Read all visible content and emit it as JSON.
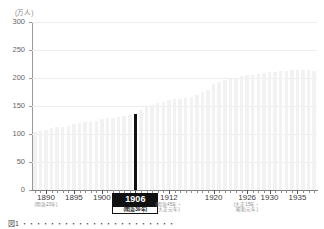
{
  "chart_data": {
    "type": "bar",
    "title": "",
    "unit_label": "(万人)",
    "xlabel": "",
    "ylabel": "",
    "ylim": [
      0,
      300
    ],
    "ytick_labels": [
      "300",
      "250",
      "200",
      "150",
      "100",
      "50",
      "0"
    ],
    "ytick_values": [
      300,
      250,
      200,
      150,
      100,
      50,
      0
    ],
    "grid": true,
    "legend": "none",
    "highlight_year": 1906,
    "highlight_value": 135,
    "x": [
      1888,
      1889,
      1890,
      1891,
      1892,
      1893,
      1894,
      1895,
      1896,
      1897,
      1898,
      1899,
      1900,
      1901,
      1902,
      1903,
      1904,
      1905,
      1906,
      1907,
      1908,
      1909,
      1910,
      1911,
      1912,
      1913,
      1914,
      1915,
      1916,
      1917,
      1918,
      1919,
      1920,
      1921,
      1922,
      1923,
      1924,
      1925,
      1926,
      1927,
      1928,
      1929,
      1930,
      1931,
      1932,
      1933,
      1934,
      1935,
      1936,
      1937,
      1938
    ],
    "values": [
      104,
      106,
      108,
      110,
      112,
      113,
      115,
      117,
      119,
      121,
      122,
      124,
      126,
      128,
      129,
      131,
      132,
      134,
      135,
      142,
      148,
      152,
      155,
      158,
      160,
      162,
      163,
      164,
      166,
      170,
      175,
      178,
      190,
      193,
      196,
      198,
      200,
      203,
      205,
      206,
      208,
      209,
      210,
      211,
      212,
      213,
      214,
      215,
      214,
      214,
      213
    ],
    "x_major_ticks": [
      {
        "year": 1890,
        "label": "1890",
        "era": [
          "(明治23年)"
        ]
      },
      {
        "year": 1895,
        "label": "1895",
        "era": []
      },
      {
        "year": 1900,
        "label": "1900",
        "era": []
      },
      {
        "year": 1906,
        "label": "1906",
        "era": [
          "(明治39年)"
        ],
        "highlight": true
      },
      {
        "year": 1912,
        "label": "1912",
        "era": [
          "(明治45年・",
          "大正元年)"
        ]
      },
      {
        "year": 1920,
        "label": "1920",
        "era": []
      },
      {
        "year": 1926,
        "label": "1926",
        "era": [
          "(大正15年・",
          "昭和元年)"
        ]
      },
      {
        "year": 1930,
        "label": "1930",
        "era": []
      },
      {
        "year": 1935,
        "label": "1935",
        "era": []
      }
    ],
    "colors": {
      "bar": "#f2f2f2",
      "highlight_bar": "#111111",
      "grid": "#ededed",
      "axis": "#8d8d8d",
      "tick_text": "#666666",
      "era_text": "#8a8a8a"
    }
  },
  "caption": {
    "text": "図1 ・・・・・・・・・・・・・・・・・・・・・・"
  }
}
